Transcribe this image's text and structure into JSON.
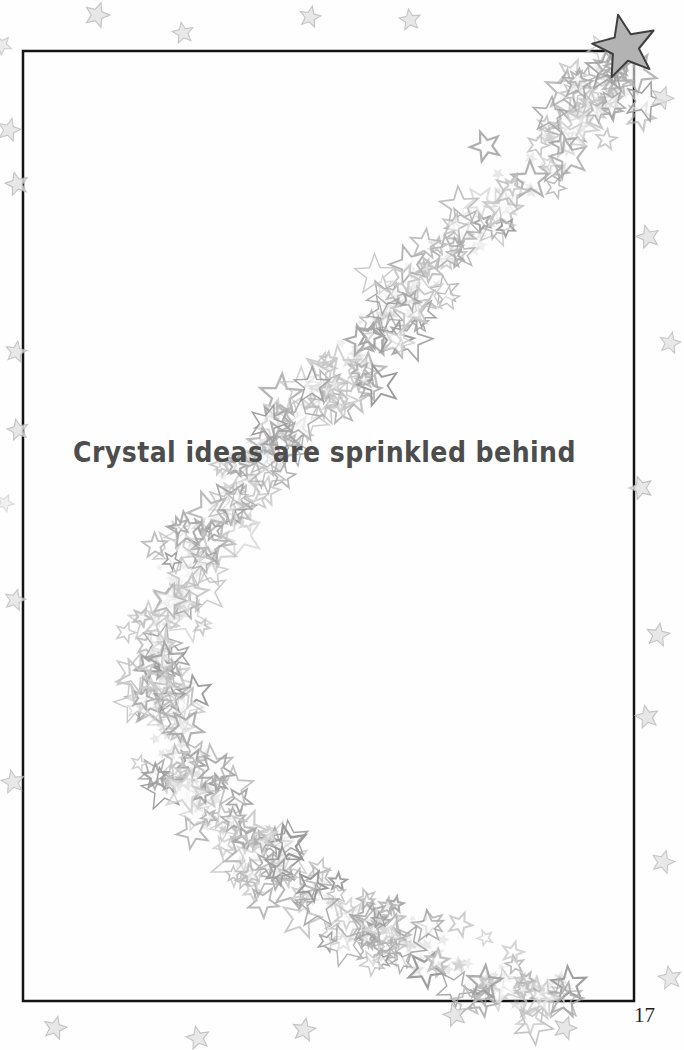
{
  "page": {
    "caption": "Crystal ideas are sprinkled behind",
    "page_number": "17",
    "background_color": "#fefefe",
    "caption_color": "#4d4d4d",
    "page_number_color": "#1f1f1f"
  },
  "artwork": {
    "border": {
      "x": 23,
      "y": 51,
      "width": 611,
      "height": 950,
      "color": "#141414",
      "stroke_width": 2.5
    },
    "corner_star": {
      "cx": 625,
      "cy": 47,
      "outer_radius": 33,
      "inner_radius": 14,
      "rotation_deg": -12,
      "fill": "#b3b3b3",
      "stroke": "#3f3f3f",
      "stroke_width": 2
    },
    "star_trail": {
      "description": "crescent trail of overlapping star-sequin outlines from top-right corner curving left then down to bottom-right",
      "centerline": [
        [
          634,
          50
        ],
        [
          600,
          92
        ],
        [
          556,
          140
        ],
        [
          510,
          188
        ],
        [
          464,
          237
        ],
        [
          418,
          285
        ],
        [
          370,
          336
        ],
        [
          322,
          388
        ],
        [
          276,
          440
        ],
        [
          234,
          492
        ],
        [
          200,
          543
        ],
        [
          174,
          594
        ],
        [
          160,
          645
        ],
        [
          158,
          694
        ],
        [
          170,
          742
        ],
        [
          194,
          788
        ],
        [
          228,
          828
        ],
        [
          268,
          862
        ],
        [
          314,
          895
        ],
        [
          364,
          924
        ],
        [
          418,
          950
        ],
        [
          472,
          972
        ],
        [
          524,
          988
        ],
        [
          566,
          1000
        ]
      ],
      "half_width": 52,
      "outline_count": 340,
      "texture_count": 320,
      "outline_gray_min": 150,
      "outline_gray_max": 210,
      "texture_color": "#aaaaaa",
      "seed": 20517
    },
    "margin_stars": {
      "fill": "#e3e3e3",
      "stroke": "#b9b9b9",
      "positions": [
        {
          "x": 97,
          "y": 15,
          "r": 13,
          "rot": 18,
          "o": 0.85
        },
        {
          "x": 183,
          "y": 33,
          "r": 11,
          "rot": -10,
          "o": 0.8
        },
        {
          "x": 310,
          "y": 17,
          "r": 11,
          "rot": 12,
          "o": 0.85
        },
        {
          "x": 410,
          "y": 20,
          "r": 11,
          "rot": -8,
          "o": 0.8
        },
        {
          "x": 2,
          "y": 45,
          "r": 10,
          "rot": 40,
          "o": 0.7
        },
        {
          "x": 9,
          "y": 130,
          "r": 12,
          "rot": 15,
          "o": 0.8
        },
        {
          "x": 17,
          "y": 184,
          "r": 12,
          "rot": -14,
          "o": 0.85
        },
        {
          "x": 16,
          "y": 352,
          "r": 11,
          "rot": 10,
          "o": 0.8
        },
        {
          "x": 18,
          "y": 430,
          "r": 11,
          "rot": -12,
          "o": 0.85
        },
        {
          "x": 5,
          "y": 503,
          "r": 9,
          "rot": 25,
          "o": 0.5
        },
        {
          "x": 15,
          "y": 600,
          "r": 11,
          "rot": 14,
          "o": 0.8
        },
        {
          "x": 13,
          "y": 782,
          "r": 12,
          "rot": -10,
          "o": 0.8
        },
        {
          "x": 662,
          "y": 98,
          "r": 12,
          "rot": 20,
          "o": 0.8
        },
        {
          "x": 648,
          "y": 237,
          "r": 12,
          "rot": -15,
          "o": 0.85
        },
        {
          "x": 670,
          "y": 343,
          "r": 11,
          "rot": 12,
          "o": 0.8
        },
        {
          "x": 641,
          "y": 488,
          "r": 12,
          "rot": -18,
          "o": 0.85
        },
        {
          "x": 658,
          "y": 635,
          "r": 12,
          "rot": 10,
          "o": 0.85
        },
        {
          "x": 647,
          "y": 717,
          "r": 12,
          "rot": -12,
          "o": 0.85
        },
        {
          "x": 663,
          "y": 862,
          "r": 12,
          "rot": 16,
          "o": 0.8
        },
        {
          "x": 670,
          "y": 978,
          "r": 12,
          "rot": -10,
          "o": 0.8
        },
        {
          "x": 55,
          "y": 1028,
          "r": 12,
          "rot": 14,
          "o": 0.85
        },
        {
          "x": 198,
          "y": 1038,
          "r": 12,
          "rot": -12,
          "o": 0.85
        },
        {
          "x": 304,
          "y": 1030,
          "r": 12,
          "rot": 10,
          "o": 0.85
        },
        {
          "x": 455,
          "y": 1015,
          "r": 12,
          "rot": -15,
          "o": 0.85
        },
        {
          "x": 565,
          "y": 1028,
          "r": 12,
          "rot": 18,
          "o": 0.85
        }
      ]
    }
  }
}
